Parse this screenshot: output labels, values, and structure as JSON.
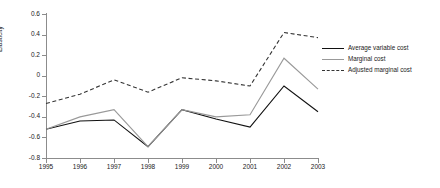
{
  "chart_data": {
    "type": "line",
    "title": "",
    "xlabel": "",
    "ylabel": "Elasticity",
    "x": [
      1995,
      1996,
      1997,
      1998,
      1999,
      2000,
      2001,
      2002,
      2003
    ],
    "categories": [
      "1995",
      "1996",
      "1997",
      "1998",
      "1999",
      "2000",
      "2001",
      "2002",
      "2003"
    ],
    "xlim": [
      1995,
      2003
    ],
    "ylim": [
      -0.8,
      0.6
    ],
    "yticks": [
      0.6,
      0.4,
      0.2,
      0,
      -0.2,
      -0.4,
      -0.6,
      -0.8
    ],
    "ytick_labels": [
      "0.6",
      "0.4",
      "0.2",
      "0",
      "-0.2",
      "-0.4",
      "-0.6",
      "-0.8"
    ],
    "grid": false,
    "legend_position": "right",
    "series": [
      {
        "name": "Average variable cost",
        "style": "solid",
        "color": "#111111",
        "values": [
          -0.52,
          -0.44,
          -0.43,
          -0.69,
          -0.33,
          -0.42,
          -0.5,
          -0.1,
          -0.35
        ]
      },
      {
        "name": "Marginal cost",
        "style": "solid",
        "color": "#999999",
        "values": [
          -0.52,
          -0.4,
          -0.33,
          -0.69,
          -0.33,
          -0.4,
          -0.38,
          0.17,
          -0.13
        ]
      },
      {
        "name": "Adjusted marginal cost",
        "style": "dashed",
        "color": "#333333",
        "values": [
          -0.27,
          -0.18,
          -0.04,
          -0.16,
          -0.02,
          -0.05,
          -0.1,
          0.42,
          0.37
        ]
      }
    ]
  },
  "axis": {
    "y_title": "Elasticity"
  },
  "legend": {
    "items": [
      {
        "label": "Average variable cost"
      },
      {
        "label": "Marginal cost"
      },
      {
        "label": "Adjusted marginal cost"
      }
    ]
  }
}
